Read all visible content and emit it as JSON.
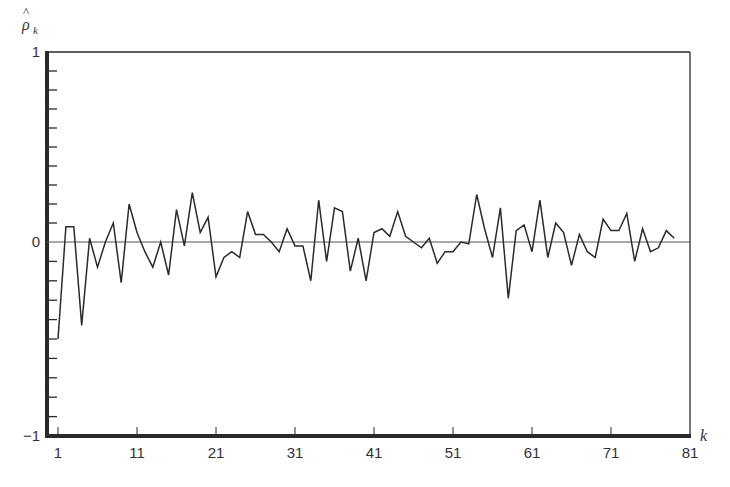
{
  "chart_data": {
    "type": "line",
    "title": "",
    "xlabel": "k",
    "ylabel": "ρ̂_k",
    "ylabel_parts": {
      "symbol": "ρ",
      "hat": "^",
      "subscript": "k"
    },
    "xlim": [
      1,
      81
    ],
    "ylim": [
      -1,
      1
    ],
    "grid": false,
    "legend": null,
    "x_ticks": [
      1,
      11,
      21,
      31,
      41,
      51,
      61,
      71,
      81
    ],
    "x_tick_labels": [
      "1",
      "11",
      "21",
      "31",
      "41",
      "51",
      "61",
      "71",
      "81"
    ],
    "y_ticks_labeled": [
      1,
      0,
      -1
    ],
    "y_tick_labels": [
      "1",
      "0",
      "−1"
    ],
    "y_minor_tick_step": 0.1,
    "zero_line": true,
    "series": [
      {
        "name": "sample autocorrelation",
        "x": [
          1,
          2,
          3,
          4,
          5,
          6,
          7,
          8,
          9,
          10,
          11,
          12,
          13,
          14,
          15,
          16,
          17,
          18,
          19,
          20,
          21,
          22,
          23,
          24,
          25,
          26,
          27,
          28,
          29,
          30,
          31,
          32,
          33,
          34,
          35,
          36,
          37,
          38,
          39,
          40,
          41,
          42,
          43,
          44,
          45,
          46,
          47,
          48,
          49,
          50,
          51,
          52,
          53,
          54,
          55,
          56,
          57,
          58,
          59,
          60,
          61,
          62,
          63,
          64,
          65,
          66,
          67,
          68,
          69,
          70,
          71,
          72,
          73,
          74,
          75,
          76,
          77,
          78,
          79
        ],
        "values": [
          -0.5,
          0.08,
          0.08,
          -0.43,
          0.02,
          -0.13,
          0.0,
          0.1,
          -0.21,
          0.2,
          0.05,
          -0.05,
          -0.13,
          0.0,
          -0.17,
          0.17,
          -0.02,
          0.26,
          0.05,
          0.13,
          -0.18,
          -0.08,
          -0.05,
          -0.08,
          0.16,
          0.04,
          0.04,
          0.0,
          -0.05,
          0.07,
          -0.02,
          -0.02,
          -0.2,
          0.22,
          -0.1,
          0.18,
          0.16,
          -0.15,
          0.02,
          -0.2,
          0.05,
          0.07,
          0.03,
          0.16,
          0.03,
          0.0,
          -0.03,
          0.02,
          -0.11,
          -0.05,
          -0.05,
          0.0,
          -0.01,
          0.25,
          0.07,
          -0.08,
          0.18,
          -0.29,
          0.06,
          0.09,
          -0.05,
          0.22,
          -0.08,
          0.1,
          0.05,
          -0.12,
          0.04,
          -0.05,
          -0.08,
          0.12,
          0.06,
          0.06,
          0.15,
          -0.1,
          0.07,
          -0.05,
          -0.03,
          0.06,
          0.02
        ]
      }
    ]
  },
  "colors": {
    "axis": "#2a2a2a",
    "line": "#2a2a2a",
    "zero_line": "#555555",
    "background": "#ffffff"
  }
}
